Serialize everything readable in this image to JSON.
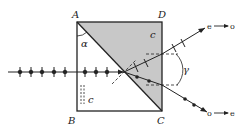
{
  "diagram": {
    "type": "optics-prism-polarizer",
    "colors": {
      "line": "#222222",
      "shaded_prism": "#c8c8c8",
      "background": "#ffffff"
    },
    "vertices": {
      "A": "A",
      "B": "B",
      "C": "C",
      "D": "D"
    },
    "labels": {
      "alpha": "α",
      "gamma": "γ",
      "axis_left": "c",
      "axis_right": "c"
    },
    "output_beams": {
      "upper": {
        "from": "e",
        "to": "o"
      },
      "lower": {
        "from": "o",
        "to": "e"
      }
    }
  }
}
